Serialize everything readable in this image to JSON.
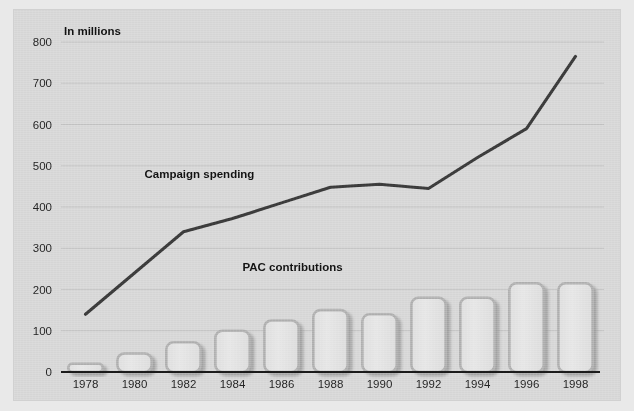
{
  "figure": {
    "unit_label": "In millions",
    "background_color": "#d7d7d7",
    "outer_color": "#e9e9e9"
  },
  "chart_data": {
    "type": "bar",
    "title": "",
    "subtitle": "",
    "xlabel": "",
    "ylabel": "In millions",
    "ylim": [
      0,
      800
    ],
    "ytick_step": 100,
    "yticks": [
      "0",
      "100",
      "200",
      "300",
      "400",
      "500",
      "600",
      "700",
      "800"
    ],
    "categories": [
      "1978",
      "1980",
      "1982",
      "1984",
      "1986",
      "1988",
      "1990",
      "1992",
      "1994",
      "1996",
      "1998"
    ],
    "grid": "horizontal",
    "legend": "inline-annotations",
    "series": [
      {
        "name": "PAC contributions",
        "type": "bar",
        "color": "#e3e3e3",
        "edge_color": "#b0b0b0",
        "values": [
          20,
          45,
          72,
          100,
          125,
          150,
          140,
          180,
          180,
          215,
          215
        ]
      },
      {
        "name": "Campaign spending",
        "type": "line",
        "color": "#3a3a3a",
        "values": [
          140,
          240,
          340,
          372,
          410,
          448,
          455,
          445,
          520,
          590,
          765
        ]
      }
    ],
    "annotations": [
      {
        "text": "Campaign spending",
        "x_category": "1980",
        "value": 470
      },
      {
        "text": "PAC contributions",
        "x_category": "1984",
        "value": 245
      }
    ]
  }
}
